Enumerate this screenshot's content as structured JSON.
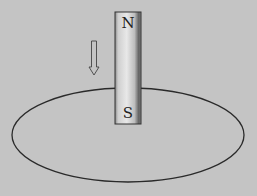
{
  "diagram": {
    "magnet": {
      "top_pole": "N",
      "bottom_pole": "S",
      "x": 115,
      "y": 12,
      "width": 26,
      "height": 112
    },
    "motion_arrow": {
      "direction": "down",
      "x": 90,
      "y": 41,
      "width": 8,
      "height": 34
    },
    "loop": {
      "shape": "ellipse",
      "cx": 128,
      "cy": 135,
      "rx": 116,
      "ry": 47
    },
    "colors": {
      "background": "#c4c4c4",
      "line": "#2a2a2a",
      "magnet_light": "#e6e6e6",
      "magnet_dark": "#5a5a5a"
    }
  }
}
